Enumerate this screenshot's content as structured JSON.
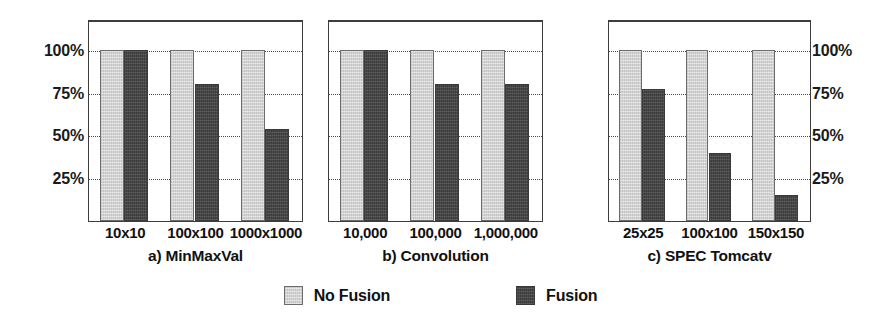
{
  "chart_data": {
    "type": "bar",
    "title": "",
    "ylabel": "",
    "xlabel": "",
    "ylim": [
      0,
      118
    ],
    "grid": true,
    "gridlines": [
      25,
      50,
      75,
      100
    ],
    "y_tick_labels": [
      "100%",
      "75%",
      "50%",
      "25%"
    ],
    "y_tick_values": [
      100,
      75,
      50,
      25
    ],
    "y_axis_left": true,
    "y_axis_right": true,
    "legend_position": "bottom-center",
    "legend": [
      {
        "name": "No Fusion",
        "color": "#d2d2d2"
      },
      {
        "name": "Fusion",
        "color": "#484848"
      }
    ],
    "series_names": [
      "No Fusion",
      "Fusion"
    ],
    "panels": [
      {
        "id": "a",
        "title": "a) MinMaxVal",
        "categories": [
          "10x10",
          "100x100",
          "1000x1000"
        ],
        "series": [
          {
            "name": "No Fusion",
            "values": [
              100,
              100,
              100
            ]
          },
          {
            "name": "Fusion",
            "values": [
              100,
              80,
              54
            ]
          }
        ]
      },
      {
        "id": "b",
        "title": "b) Convolution",
        "categories": [
          "10,000",
          "100,000",
          "1,000,000"
        ],
        "series": [
          {
            "name": "No Fusion",
            "values": [
              100,
              100,
              100
            ]
          },
          {
            "name": "Fusion",
            "values": [
              100,
              80,
              80
            ]
          }
        ]
      },
      {
        "id": "c",
        "title": "c) SPEC Tomcatv",
        "categories": [
          "25x25",
          "100x100",
          "150x150"
        ],
        "series": [
          {
            "name": "No Fusion",
            "values": [
              100,
              100,
              100
            ]
          },
          {
            "name": "Fusion",
            "values": [
              77,
              40,
              15
            ]
          }
        ]
      }
    ]
  },
  "layout": {
    "panel_geometry": [
      {
        "left": 88,
        "width": 215
      },
      {
        "left": 328,
        "width": 215
      },
      {
        "left": 608,
        "width": 203
      }
    ]
  }
}
